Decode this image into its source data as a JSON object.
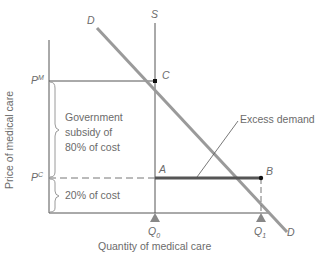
{
  "diagram": {
    "y_axis_label": "Price of medical care",
    "x_axis_label": "Quantity of medical care",
    "curves": {
      "demand_label_top": "D",
      "demand_label_bottom": "D",
      "supply_label": "S"
    },
    "points": {
      "C": "C",
      "A": "A",
      "B": "B"
    },
    "price_levels": {
      "pm_base": "P",
      "pm_sup": "M",
      "pc_base": "P",
      "pc_sup": "C"
    },
    "quantities": {
      "q0_base": "Q",
      "q0_sub": "0",
      "q1_base": "Q",
      "q1_sub": "1"
    },
    "annotations": {
      "subsidy_line1": "Government",
      "subsidy_line2": "subsidy of",
      "subsidy_line3": "80% of cost",
      "consumer_share": "20% of cost",
      "excess_demand": "Excess demand"
    },
    "colors": {
      "axis": "#555555",
      "demand": "#9a9a9a",
      "text": "#6b6b6b",
      "excess_bar": "#555555",
      "brace": "#9a9a9a"
    }
  }
}
